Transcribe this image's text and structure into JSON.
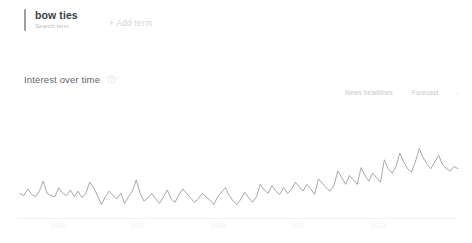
{
  "header": {
    "term_title": "bow ties",
    "term_subtitle": "Search term",
    "add_term_label": "+ Add term",
    "accent_color": "#9aa0a6"
  },
  "section": {
    "title": "Interest over time",
    "help_icon": "help-icon"
  },
  "legend": {
    "news_headlines": "News headlines",
    "forecast": "Forecast",
    "caret_icon": "chevron-down-icon"
  },
  "chart_data": {
    "type": "line",
    "title": "Interest over time",
    "xlabel": "",
    "ylabel": "",
    "ylim": [
      0,
      100
    ],
    "grid": false,
    "legend_position": "top-right",
    "line_color": "#9e9e9e",
    "annotations": [
      "News headlines",
      "Forecast"
    ],
    "xtick_labels": [
      "2005",
      "2007",
      "2009",
      "2011",
      "2013"
    ],
    "xtick_positions": [
      58,
      138,
      218,
      298,
      378
    ],
    "series": [
      {
        "name": "bow ties",
        "values": [
          22,
          20,
          26,
          21,
          19,
          24,
          33,
          22,
          20,
          19,
          27,
          22,
          20,
          25,
          19,
          24,
          18,
          22,
          32,
          27,
          20,
          12,
          19,
          24,
          20,
          17,
          22,
          13,
          19,
          24,
          34,
          22,
          15,
          18,
          22,
          17,
          13,
          19,
          25,
          17,
          14,
          21,
          26,
          22,
          18,
          14,
          17,
          22,
          19,
          16,
          12,
          19,
          23,
          27,
          20,
          15,
          12,
          17,
          23,
          18,
          14,
          19,
          30,
          25,
          22,
          29,
          24,
          21,
          27,
          22,
          25,
          32,
          28,
          24,
          30,
          26,
          21,
          35,
          31,
          27,
          24,
          29,
          42,
          36,
          30,
          38,
          34,
          30,
          45,
          38,
          33,
          40,
          36,
          32,
          52,
          44,
          40,
          46,
          58,
          50,
          44,
          41,
          50,
          62,
          54,
          48,
          44,
          50,
          56,
          48,
          44,
          42,
          46,
          44
        ]
      }
    ]
  }
}
